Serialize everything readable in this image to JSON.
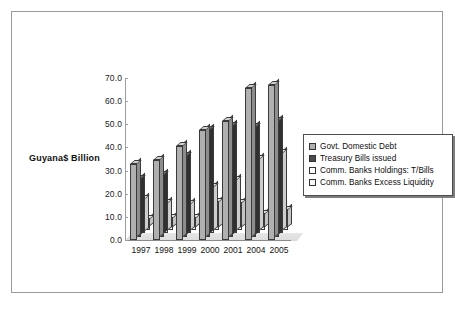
{
  "chart_data": {
    "type": "bar",
    "title": "",
    "subtitle": "",
    "xlabel": "",
    "ylabel": "Guyana$ Billion",
    "ylim": [
      0.0,
      70.0
    ],
    "ytick_labels": [
      "70.0",
      "60.0",
      "50.0",
      "40.0",
      "30.0",
      "20.0",
      "10.0",
      "0.0"
    ],
    "ytick_values": [
      70.0,
      60.0,
      50.0,
      40.0,
      30.0,
      20.0,
      10.0,
      0.0
    ],
    "grid": false,
    "legend_position": "right",
    "style": "3d-clustered-column",
    "categories": [
      "1997",
      "1998",
      "1999",
      "2000",
      "2001",
      "2004",
      "2005"
    ],
    "series": [
      {
        "name": "Govt. Domestic Debt",
        "color": "#b0b0b0",
        "values": [
          33.0,
          34.5,
          40.5,
          47.5,
          51.5,
          65.5,
          67.0
        ]
      },
      {
        "name": "Treasury Bills issued",
        "color": "#4a4a4a",
        "values": [
          25.0,
          26.5,
          35.0,
          46.0,
          48.0,
          47.5,
          50.0
        ]
      },
      {
        "name": "Comm. Banks  Holdings: T/Bills",
        "color": "#ffffff",
        "values": [
          15.0,
          13.0,
          12.5,
          20.0,
          23.0,
          32.0,
          34.5
        ]
      },
      {
        "name": "Comm. Banks Excess Liquidity",
        "color": "#f7f7f7",
        "values": [
          4.5,
          5.0,
          5.0,
          12.0,
          11.5,
          7.0,
          8.5
        ]
      }
    ]
  },
  "axis": {
    "y_title": "Guyana$ Billion"
  },
  "legend": {
    "items": [
      {
        "label": "Govt. Domestic Debt",
        "color": "#b0b0b0"
      },
      {
        "label": "Treasury Bills issued",
        "color": "#4a4a4a"
      },
      {
        "label": "Comm. Banks  Holdings: T/Bills",
        "color": "#ffffff"
      },
      {
        "label": "Comm. Banks Excess Liquidity",
        "color": "#f7f7f7"
      }
    ]
  }
}
